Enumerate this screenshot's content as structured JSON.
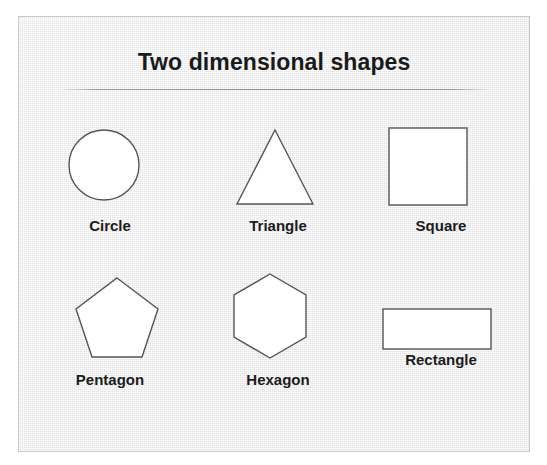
{
  "poster": {
    "title": "Two dimensional shapes",
    "background_color": "#ebebeb",
    "border_color": "#c9c9c9",
    "rule_color": "#8e8e8e",
    "title_color": "#1a1a1a",
    "shape_stroke_color": "#555555",
    "shape_fill_color": "#ffffff"
  },
  "shapes": [
    {
      "name": "circle",
      "label": "Circle",
      "sides": 0
    },
    {
      "name": "triangle",
      "label": "Triangle",
      "sides": 3
    },
    {
      "name": "square",
      "label": "Square",
      "sides": 4
    },
    {
      "name": "pentagon",
      "label": "Pentagon",
      "sides": 5
    },
    {
      "name": "hexagon",
      "label": "Hexagon",
      "sides": 6
    },
    {
      "name": "rectangle",
      "label": "Rectangle",
      "sides": 4
    }
  ]
}
